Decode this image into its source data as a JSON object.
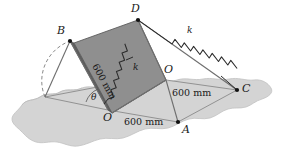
{
  "figure": {
    "colors": {
      "ground": "#d4d4d4",
      "ground_edge": "#b9b9b9",
      "plate_face": "#909090",
      "plate_edge": "#5a5a5a",
      "line": "#707070",
      "ink": "#1a1a1a",
      "spring": "#2b2b2b"
    }
  },
  "points": {
    "A": "A",
    "B": "B",
    "C": "C",
    "D": "D",
    "O_origin": "O",
    "O_right": "O"
  },
  "springs": [
    {
      "name": "upper-spring",
      "label": "k"
    },
    {
      "name": "lower-spring",
      "label": "k"
    }
  ],
  "dimensions": [
    {
      "name": "dim-plate-edge",
      "text": "600 mm"
    },
    {
      "name": "dim-oc",
      "text": "600 mm"
    },
    {
      "name": "dim-oa",
      "text": "600 mm"
    }
  ],
  "angle": {
    "label": "θ"
  }
}
